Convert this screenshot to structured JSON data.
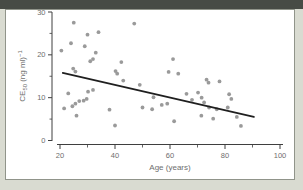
{
  "window": {
    "top_bar_color": "#474b45",
    "background_color": "#d9dbd1",
    "panel_background": "#ffffff",
    "panel_border_color": "#90948a"
  },
  "chart_data": {
    "type": "scatter",
    "title": "",
    "xlabel": "Age (years)",
    "ylabel_text": "CE50 (ng ml)-1",
    "ylabel_parts": {
      "prefix": "CE",
      "subscript": "50",
      "middle": " (ng ml)",
      "superscript": "−1"
    },
    "xlim": [
      20,
      100
    ],
    "ylim": [
      0,
      30
    ],
    "x_ticks": [
      20,
      40,
      60,
      80,
      100
    ],
    "x_minor_ticks": [
      30,
      50,
      70,
      90
    ],
    "y_ticks": [
      0,
      10,
      20,
      30
    ],
    "y_minor_ticks": [
      5,
      15,
      25
    ],
    "grid": "off",
    "legend": "none",
    "point_color": "#9a9a9a",
    "trend_color": "#1f1f1f",
    "axis_color": "#3f3f3f",
    "tick_label_color": "#6e6e6e",
    "points": [
      [
        20.5,
        21
      ],
      [
        21.5,
        7.5
      ],
      [
        23,
        11
      ],
      [
        24,
        22.7
      ],
      [
        24.5,
        8
      ],
      [
        24.8,
        16.8
      ],
      [
        25,
        27.5
      ],
      [
        25.6,
        16.1
      ],
      [
        25.6,
        8.6
      ],
      [
        26,
        5.8
      ],
      [
        27,
        9.2
      ],
      [
        28.6,
        9.3
      ],
      [
        29,
        22
      ],
      [
        29.7,
        9.7
      ],
      [
        30,
        24.7
      ],
      [
        30.2,
        11.4
      ],
      [
        31,
        18.5
      ],
      [
        32,
        11.8
      ],
      [
        32,
        19
      ],
      [
        33,
        20.5
      ],
      [
        34,
        25.3
      ],
      [
        38,
        7.2
      ],
      [
        40,
        3.5
      ],
      [
        40.2,
        16.2
      ],
      [
        40.8,
        15.6
      ],
      [
        42.3,
        18.3
      ],
      [
        43,
        14
      ],
      [
        47,
        27.3
      ],
      [
        49,
        13
      ],
      [
        50,
        7.7
      ],
      [
        53.5,
        7.3
      ],
      [
        54,
        10.1
      ],
      [
        57,
        8.3
      ],
      [
        59,
        8.6
      ],
      [
        59.5,
        16
      ],
      [
        61.1,
        19
      ],
      [
        61.5,
        4.5
      ],
      [
        63,
        15.6
      ],
      [
        66,
        10.9
      ],
      [
        68,
        9.5
      ],
      [
        70.2,
        11.2
      ],
      [
        71.4,
        5.8
      ],
      [
        71.5,
        10
      ],
      [
        72.4,
        8.9
      ],
      [
        73.3,
        14.2
      ],
      [
        74,
        13.5
      ],
      [
        74.2,
        7.7
      ],
      [
        75.7,
        5.1
      ],
      [
        77,
        7.3
      ],
      [
        78,
        13.8
      ],
      [
        81,
        7.7
      ],
      [
        81.5,
        10.8
      ],
      [
        82.3,
        9.7
      ],
      [
        84.3,
        5.5
      ],
      [
        85.8,
        3.4
      ]
    ],
    "trend_line": {
      "x1": 21,
      "y1": 15.8,
      "x2": 90.5,
      "y2": 5.5
    }
  }
}
